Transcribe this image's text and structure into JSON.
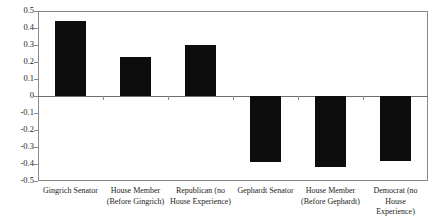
{
  "chart_data": {
    "type": "bar",
    "title": "",
    "subtitle": "",
    "xlabel": "",
    "ylabel": "",
    "ylim": [
      -0.5,
      0.5
    ],
    "grid": false,
    "legend": null,
    "bar_color": "#0d0d0d",
    "frame_color": "#8a8a8a",
    "categories": [
      "Gingrich Senator",
      "House Member (Before Gingrich)",
      "Republican (no House Experience)",
      "Gephardt Senator",
      "House Member (Before Gephardt)",
      "Democrat (no House Experience)"
    ],
    "category_lines": [
      [
        "Gingrich Senator"
      ],
      [
        "House Member",
        "(Before Gingrich)"
      ],
      [
        "Republican (no",
        "House Experience)"
      ],
      [
        "Gephardt Senator"
      ],
      [
        "House Member",
        "(Before Gephardt)"
      ],
      [
        "Democrat (no House",
        "Experience)"
      ]
    ],
    "values": [
      0.44,
      0.23,
      0.3,
      -0.39,
      -0.42,
      -0.38
    ],
    "yticks": [
      0.5,
      0.4,
      0.3,
      0.2,
      0.1,
      0,
      -0.1,
      -0.2,
      -0.3,
      -0.4,
      -0.5
    ],
    "ytick_labels": [
      "0.5",
      "0.4",
      "0.3",
      "0.2",
      "0.1",
      "0",
      "-0.1",
      "-0.2",
      "-0.3",
      "-0.4",
      "-0.5"
    ]
  }
}
